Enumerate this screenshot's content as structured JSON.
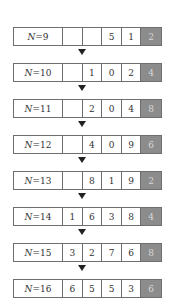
{
  "diagram": {
    "title": "",
    "highlight_color": "#8c8c8c",
    "rows": [
      {
        "label_var": "N",
        "label_eq": "=9",
        "digits": [
          "",
          "",
          "5",
          "1",
          "2"
        ]
      },
      {
        "label_var": "N",
        "label_eq": "=10",
        "digits": [
          "",
          "1",
          "0",
          "2",
          "4"
        ]
      },
      {
        "label_var": "N",
        "label_eq": "=11",
        "digits": [
          "",
          "2",
          "0",
          "4",
          "8"
        ]
      },
      {
        "label_var": "N",
        "label_eq": "=12",
        "digits": [
          "",
          "4",
          "0",
          "9",
          "6"
        ]
      },
      {
        "label_var": "N",
        "label_eq": "=13",
        "digits": [
          "",
          "8",
          "1",
          "9",
          "2"
        ]
      },
      {
        "label_var": "N",
        "label_eq": "=14",
        "digits": [
          "1",
          "6",
          "3",
          "8",
          "4"
        ]
      },
      {
        "label_var": "N",
        "label_eq": "=15",
        "digits": [
          "3",
          "2",
          "7",
          "6",
          "8"
        ]
      },
      {
        "label_var": "N",
        "label_eq": "=16",
        "digits": [
          "6",
          "5",
          "5",
          "3",
          "6"
        ]
      }
    ],
    "highlighted_cell_index": 4,
    "arrow_icon": "down-triangle-icon"
  }
}
